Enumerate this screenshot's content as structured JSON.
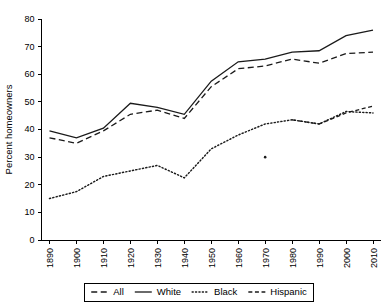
{
  "chart_data": {
    "type": "line",
    "title": "",
    "xlabel": "",
    "ylabel": "Percent homeowners",
    "x": [
      1890,
      1900,
      1910,
      1920,
      1930,
      1940,
      1950,
      1960,
      1970,
      1980,
      1990,
      2000,
      2010
    ],
    "xtick_labels": [
      "1890",
      "1900",
      "1910",
      "1920",
      "1930",
      "1940",
      "1950",
      "1960",
      "1970",
      "1980",
      "1990",
      "2000",
      "2010"
    ],
    "ytick_labels": [
      "0",
      "10",
      "20",
      "30",
      "40",
      "50",
      "60",
      "70",
      "80"
    ],
    "yticks": [
      0,
      10,
      20,
      30,
      40,
      50,
      60,
      70,
      80
    ],
    "ylim": [
      0,
      80
    ],
    "xlim": [
      1890,
      2010
    ],
    "grid": false,
    "legend_position": "bottom",
    "series": [
      {
        "name": "All",
        "style": "dashed",
        "color": "#1a1a1a",
        "x": [
          1890,
          1900,
          1910,
          1920,
          1930,
          1940,
          1950,
          1960,
          1970,
          1980,
          1990,
          2000,
          2010
        ],
        "values": [
          37.0,
          35.0,
          39.5,
          45.5,
          47.0,
          44.0,
          55.5,
          62.0,
          63.0,
          65.5,
          64.0,
          67.5,
          68.0
        ]
      },
      {
        "name": "White",
        "style": "solid",
        "color": "#1a1a1a",
        "x": [
          1890,
          1900,
          1910,
          1920,
          1930,
          1940,
          1950,
          1960,
          1970,
          1980,
          1990,
          2000,
          2010
        ],
        "values": [
          39.5,
          37.0,
          40.5,
          49.5,
          48.0,
          45.5,
          57.5,
          64.5,
          65.5,
          68.0,
          68.5,
          74.0,
          76.0
        ]
      },
      {
        "name": "Black",
        "style": "dotted",
        "color": "#1a1a1a",
        "x": [
          1890,
          1900,
          1910,
          1920,
          1930,
          1940,
          1950,
          1960,
          1970,
          1980,
          1990,
          2000,
          2010
        ],
        "values": [
          15.0,
          17.5,
          23.0,
          25.0,
          27.0,
          22.5,
          33.0,
          38.0,
          42.0,
          43.5,
          42.0,
          46.5,
          46.0
        ]
      },
      {
        "name": "Hispanic",
        "style": "dash-dot",
        "color": "#1a1a1a",
        "x": [
          1970,
          1980,
          1990,
          2000,
          2010
        ],
        "values": [
          30.0,
          43.5,
          42.0,
          46.0,
          48.5
        ]
      }
    ],
    "legend": [
      {
        "label": "All",
        "style": "dashed"
      },
      {
        "label": "White",
        "style": "solid"
      },
      {
        "label": "Black",
        "style": "dotted"
      },
      {
        "label": "Hispanic",
        "style": "dash-dot"
      }
    ]
  }
}
